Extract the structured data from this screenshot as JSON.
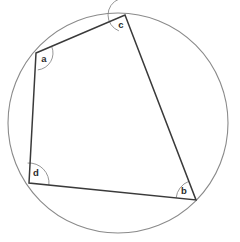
{
  "figure": {
    "canvas": {
      "width": 240,
      "height": 242,
      "background": "#ffffff"
    },
    "colors": {
      "circle_stroke": "#8a8a8a",
      "quad_stroke": "#3a3a3a",
      "angle_arc_stroke": "#8a8a8a",
      "label_fill": "#2b2b2b",
      "background": "#ffffff"
    },
    "circle": {
      "name": "circumcircle",
      "center_x": 118,
      "center_y": 123,
      "radius": 110,
      "stroke_width": 1.1
    },
    "quadrilateral": {
      "name": "inscribed-quadrilateral",
      "stroke_width": 1.5,
      "fill": "none",
      "points": "36,53 125,15 196,200 29,183",
      "vertices": [
        {
          "id": "a",
          "label": "a",
          "x": 36,
          "y": 53,
          "label_x": 44,
          "label_y": 59
        },
        {
          "id": "c",
          "label": "c",
          "x": 125,
          "y": 15,
          "label_x": 121,
          "label_y": 25
        },
        {
          "id": "b",
          "label": "b",
          "x": 196,
          "y": 200,
          "label_x": 184,
          "label_y": 191
        },
        {
          "id": "d",
          "label": "d",
          "x": 29,
          "y": 183,
          "label_x": 36,
          "label_y": 173
        }
      ],
      "edges": [
        {
          "id": "a-c",
          "from": "a",
          "to": "c"
        },
        {
          "id": "c-b",
          "from": "c",
          "to": "b"
        },
        {
          "id": "b-d",
          "from": "b",
          "to": "d"
        },
        {
          "id": "d-a",
          "from": "d",
          "to": "a"
        }
      ]
    },
    "angle_arcs": [
      {
        "id": "angle-a",
        "cx": 36,
        "cy": 53,
        "r": 17,
        "start_deg": -23,
        "end_deg": 84,
        "stroke_width": 0.9
      },
      {
        "id": "angle-c",
        "cx": 125,
        "cy": 15,
        "r": 17,
        "start_deg": 111,
        "end_deg": 249,
        "stroke_width": 0.9
      },
      {
        "id": "angle-b",
        "cx": 196,
        "cy": 200,
        "r": 20,
        "start_deg": 186,
        "end_deg": 249,
        "stroke_width": 0.9
      },
      {
        "id": "angle-d",
        "cx": 29,
        "cy": 183,
        "r": 20,
        "start_deg": -94,
        "end_deg": 6,
        "stroke_width": 0.9
      }
    ]
  }
}
